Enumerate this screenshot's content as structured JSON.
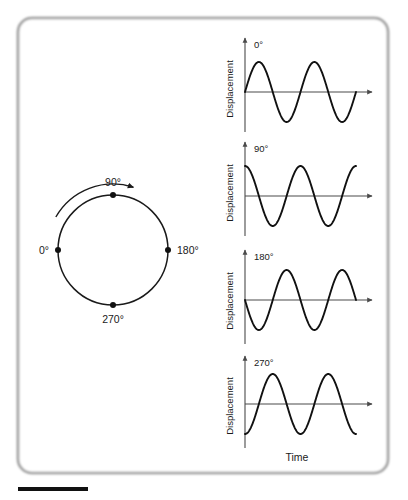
{
  "figure": {
    "type": "physics-phase-diagram",
    "background_color": "#ffffff",
    "frame": {
      "border_color": "#9a9a9a",
      "corner_radius": 14,
      "x": 18,
      "y": 18,
      "width": 370,
      "height": 455
    },
    "scale_bar": {
      "name": "scale-bar",
      "x": 18,
      "y": 487,
      "width": 70,
      "height": 4,
      "color": "#111111"
    }
  },
  "circle_diagram": {
    "name": "phase-circle",
    "center_x": 113,
    "center_y": 250,
    "radius": 55,
    "rotation_direction": "counterclockwise",
    "points": [
      {
        "label": "0°",
        "angle_deg": 180,
        "text_anchor": "end",
        "dx": -9,
        "dy": 4
      },
      {
        "label": "90°",
        "angle_deg": 90,
        "text_anchor": "middle",
        "dx": 0,
        "dy": -9
      },
      {
        "label": "180°",
        "angle_deg": 0,
        "text_anchor": "start",
        "dx": 9,
        "dy": 4
      },
      {
        "label": "270°",
        "angle_deg": 270,
        "text_anchor": "middle",
        "dx": 0,
        "dy": 18
      }
    ]
  },
  "waveform_panels": [
    {
      "name": "waveform-panel-0",
      "phase_label": "0°",
      "phase_deg": 0,
      "y_axis_title": "Displacement",
      "baseline_y": 92,
      "axis_top_y": 38,
      "axis_bottom_y": 132,
      "axis_x": 245,
      "axis_right_x": 372,
      "amplitude": 30,
      "cycles": 2.0,
      "wave_end_x": 356,
      "label_x": 254,
      "label_y": 48
    },
    {
      "name": "waveform-panel-90",
      "phase_label": "90°",
      "phase_deg": 90,
      "y_axis_title": "Displacement",
      "baseline_y": 196,
      "axis_top_y": 142,
      "axis_bottom_y": 236,
      "axis_x": 245,
      "axis_right_x": 372,
      "amplitude": 30,
      "cycles": 2.0,
      "wave_end_x": 356,
      "label_x": 254,
      "label_y": 152
    },
    {
      "name": "waveform-panel-180",
      "phase_label": "180°",
      "phase_deg": 180,
      "y_axis_title": "Displacement",
      "baseline_y": 300,
      "axis_top_y": 250,
      "axis_bottom_y": 344,
      "axis_x": 245,
      "axis_right_x": 372,
      "amplitude": 30,
      "cycles": 2.0,
      "wave_end_x": 356,
      "label_x": 254,
      "label_y": 260
    },
    {
      "name": "waveform-panel-270",
      "phase_label": "270°",
      "phase_deg": 270,
      "y_axis_title": "Displacement",
      "baseline_y": 404,
      "axis_top_y": 356,
      "axis_bottom_y": 448,
      "axis_x": 245,
      "axis_right_x": 372,
      "amplitude": 30,
      "cycles": 2.0,
      "wave_end_x": 356,
      "label_x": 254,
      "label_y": 366
    }
  ],
  "x_axis_title": "Time",
  "x_axis_title_x": 297,
  "x_axis_title_y": 461,
  "chart_data": {
    "type": "line",
    "xlabel": "Time",
    "ylabel": "Displacement",
    "grid": false,
    "legend": "none",
    "ylim": [
      -1,
      1
    ],
    "x_cycles": 2.0,
    "series": [
      {
        "name": "0°",
        "phase_deg": 0,
        "function": "sin(x)",
        "start_value": 0,
        "first_extreme": "maximum"
      },
      {
        "name": "90°",
        "phase_deg": 90,
        "function": "cos(x)",
        "start_value": 1,
        "first_extreme": "maximum"
      },
      {
        "name": "180°",
        "phase_deg": 180,
        "function": "-sin(x)",
        "start_value": 0,
        "first_extreme": "minimum"
      },
      {
        "name": "270°",
        "phase_deg": 270,
        "function": "-cos(x)",
        "start_value": -1,
        "first_extreme": "minimum"
      }
    ],
    "circle_markers": [
      0,
      90,
      180,
      270
    ]
  }
}
